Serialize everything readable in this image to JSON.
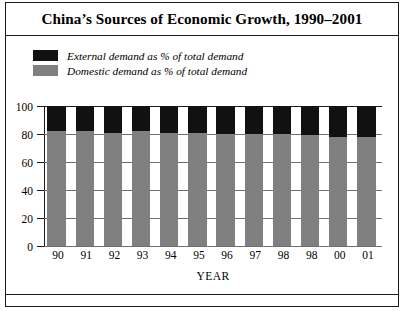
{
  "figure": {
    "title": "China’s Sources of Economic Growth, 1990–2001"
  },
  "legend": {
    "position": "top-left",
    "items": [
      {
        "label": "External demand as % of total demand",
        "color": "#111111",
        "swatch_name": "legend-swatch-external"
      },
      {
        "label": "Domestic demand as % of total demand",
        "color": "#808080",
        "swatch_name": "legend-swatch-domestic"
      }
    ]
  },
  "axes": {
    "y_ticks": [
      "100",
      "80",
      "60",
      "40",
      "20",
      "0"
    ],
    "x_title": "YEAR"
  },
  "chart_data": {
    "type": "bar",
    "title": "China’s Sources of Economic Growth, 1990–2001",
    "subtype": "stacked-100-percent",
    "xlabel": "YEAR",
    "ylabel": "",
    "ylim": [
      0,
      100
    ],
    "yticks": [
      0,
      20,
      40,
      60,
      80,
      100
    ],
    "grid": true,
    "legend_position": "top-left",
    "categories": [
      "90",
      "91",
      "92",
      "93",
      "94",
      "95",
      "96",
      "97",
      "98",
      "98",
      "00",
      "01"
    ],
    "series": [
      {
        "name": "Domestic demand as % of total demand",
        "color": "#808080",
        "values": [
          82,
          82,
          81,
          82,
          81,
          81,
          80,
          80,
          80,
          79,
          78,
          78
        ]
      },
      {
        "name": "External demand as % of total demand",
        "color": "#111111",
        "values": [
          18,
          18,
          19,
          18,
          19,
          19,
          20,
          20,
          20,
          21,
          22,
          22
        ]
      }
    ]
  }
}
